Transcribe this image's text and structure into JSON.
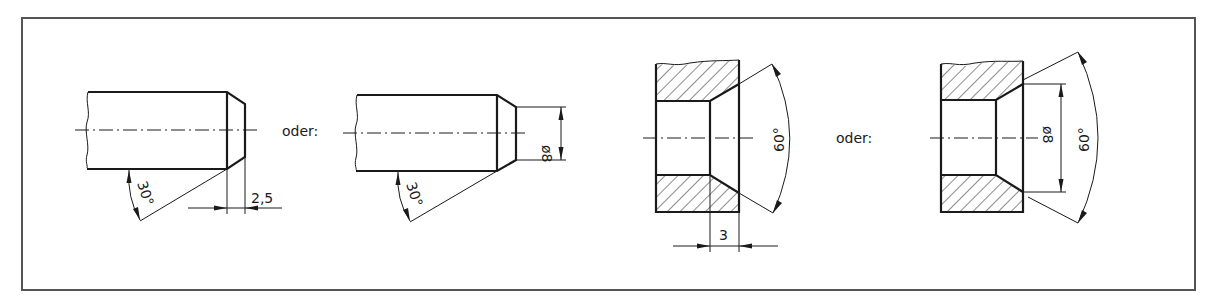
{
  "figure": {
    "type": "technical-drawing",
    "frame_color": "#555555",
    "line_color": "#1a1a1a"
  },
  "views": [
    {
      "id": "shaft-chamfer-length",
      "kind": "shaft",
      "angle_label": "30°",
      "length_label": "2,5"
    },
    {
      "id": "shaft-chamfer-diameter",
      "kind": "shaft",
      "separator_label": "oder:",
      "angle_label": "30°",
      "diameter_label": "ø8"
    },
    {
      "id": "bore-countersink-depth",
      "kind": "bore-section",
      "angle_label": "60°",
      "depth_label": "3"
    },
    {
      "id": "bore-countersink-diameter",
      "kind": "bore-section",
      "separator_label": "oder:",
      "angle_label": "60°",
      "diameter_label": "ø8"
    }
  ]
}
